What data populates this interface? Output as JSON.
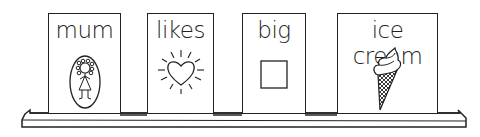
{
  "cards": [
    {
      "word": "mum",
      "picture": "mum-portrait-icon"
    },
    {
      "word": "likes",
      "picture": "heart-icon"
    },
    {
      "word": "big",
      "picture": "square-icon"
    },
    {
      "word": "ice cream",
      "picture": "ice-cream-cone-icon"
    }
  ],
  "colors": {
    "line": "#222222",
    "background": "#ffffff"
  }
}
